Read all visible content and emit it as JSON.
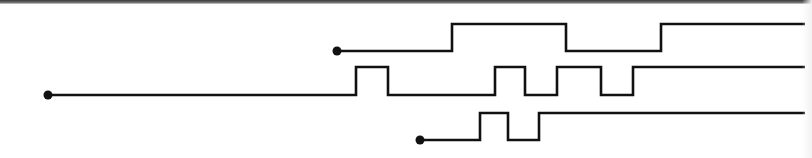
{
  "diagram": {
    "type": "timing-diagram",
    "stroke_color": "#111111",
    "background_color": "#ffffff",
    "stroke_width": 2.6,
    "dot_radius": 4.5,
    "signals": [
      {
        "name": "signal-1",
        "start": {
          "x": 337,
          "y": 51
        },
        "low_y": 51,
        "high_y": 24,
        "points": [
          [
            337,
            51
          ],
          [
            452,
            51
          ],
          [
            452,
            24
          ],
          [
            566,
            24
          ],
          [
            566,
            51
          ],
          [
            661,
            51
          ],
          [
            661,
            24
          ],
          [
            805,
            24
          ]
        ]
      },
      {
        "name": "signal-2",
        "start": {
          "x": 48,
          "y": 95
        },
        "low_y": 95,
        "high_y": 67,
        "points": [
          [
            48,
            95
          ],
          [
            356,
            95
          ],
          [
            356,
            67
          ],
          [
            388,
            67
          ],
          [
            388,
            95
          ],
          [
            495,
            95
          ],
          [
            495,
            67
          ],
          [
            525,
            67
          ],
          [
            525,
            95
          ],
          [
            557,
            95
          ],
          [
            557,
            67
          ],
          [
            601,
            67
          ],
          [
            601,
            95
          ],
          [
            633,
            95
          ],
          [
            633,
            67
          ],
          [
            805,
            67
          ]
        ]
      },
      {
        "name": "signal-3",
        "start": {
          "x": 420,
          "y": 140
        },
        "low_y": 140,
        "high_y": 113,
        "points": [
          [
            420,
            140
          ],
          [
            480,
            140
          ],
          [
            480,
            113
          ],
          [
            508,
            113
          ],
          [
            508,
            140
          ],
          [
            539,
            140
          ],
          [
            539,
            113
          ],
          [
            805,
            113
          ]
        ]
      }
    ]
  }
}
